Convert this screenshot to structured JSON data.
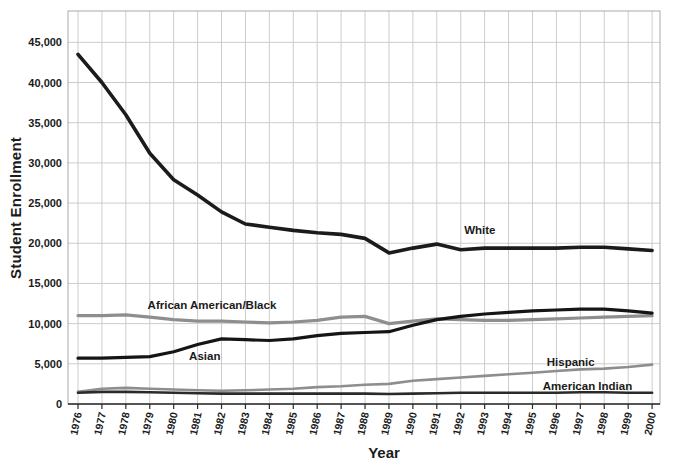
{
  "page": {
    "background": "#ffffff"
  },
  "chart_data": {
    "type": "line",
    "title": "",
    "xlabel": "Year",
    "ylabel": "Student Enrollment",
    "x": [
      1976,
      1977,
      1978,
      1979,
      1980,
      1981,
      1982,
      1983,
      1984,
      1985,
      1986,
      1987,
      1988,
      1989,
      1990,
      1991,
      1992,
      1993,
      1994,
      1995,
      1996,
      1997,
      1998,
      1999,
      2000
    ],
    "x_tick_labels": [
      "1976",
      "1977",
      "1978",
      "1979",
      "1980",
      "1981",
      "1982",
      "1983",
      "1984",
      "1985",
      "1986",
      "1987",
      "1988",
      "1989",
      "1990",
      "1991",
      "1992",
      "1993",
      "1994",
      "1995",
      "1996",
      "1997",
      "1998",
      "1999",
      "2000"
    ],
    "y_tick_values": [
      0,
      5000,
      10000,
      15000,
      20000,
      25000,
      30000,
      35000,
      40000,
      45000
    ],
    "y_tick_labels": [
      "0",
      "5,000",
      "10,000",
      "15,000",
      "20,000",
      "25,000",
      "30,000",
      "35,000",
      "40,000",
      "45,000"
    ],
    "ylim": [
      0,
      48900
    ],
    "grid": true,
    "legend_position": "inline-labels",
    "colors": {
      "gridline": "#cccccc",
      "plot_border": "#aaaaaa",
      "axis": "#2b2b2b",
      "text": "#1a1a1a"
    },
    "series": [
      {
        "name": "White",
        "color": "#1b1b1b",
        "width": 3.6,
        "label": {
          "text": "White",
          "year": 1992.8,
          "value": 21600
        },
        "values": [
          43500,
          40000,
          36000,
          31200,
          27900,
          26000,
          23900,
          22400,
          22000,
          21600,
          21300,
          21100,
          20600,
          18800,
          19400,
          19900,
          19200,
          19400,
          19400,
          19400,
          19400,
          19500,
          19500,
          19300,
          19100
        ]
      },
      {
        "name": "African American/Black",
        "color": "#8e8e8e",
        "width": 3.2,
        "label": {
          "text": "African American/Black",
          "year": 1981.6,
          "value": 12350
        },
        "values": [
          11000,
          11000,
          11100,
          10800,
          10500,
          10300,
          10300,
          10200,
          10100,
          10200,
          10400,
          10800,
          10900,
          10000,
          10300,
          10600,
          10500,
          10400,
          10400,
          10500,
          10600,
          10700,
          10800,
          10900,
          11000
        ]
      },
      {
        "name": "Asian",
        "color": "#151515",
        "width": 3.2,
        "label": {
          "text": "Asian",
          "year": 1981.3,
          "value": 5950
        },
        "values": [
          5700,
          5700,
          5800,
          5900,
          6500,
          7400,
          8100,
          8000,
          7900,
          8100,
          8500,
          8800,
          8900,
          9000,
          9800,
          10500,
          10900,
          11200,
          11400,
          11600,
          11700,
          11800,
          11800,
          11600,
          11300
        ]
      },
      {
        "name": "Hispanic",
        "color": "#8e8e8e",
        "width": 2.6,
        "label": {
          "text": "Hispanic",
          "year": 1996.6,
          "value": 5200
        },
        "values": [
          1500,
          1900,
          2000,
          1900,
          1800,
          1700,
          1650,
          1700,
          1800,
          1900,
          2100,
          2200,
          2400,
          2500,
          2900,
          3100,
          3300,
          3500,
          3700,
          3900,
          4100,
          4300,
          4400,
          4600,
          4900
        ]
      },
      {
        "name": "American Indian",
        "color": "#2a2a2a",
        "width": 2.6,
        "label": {
          "text": "American Indian",
          "year": 1997.3,
          "value": 2300
        },
        "values": [
          1400,
          1500,
          1500,
          1450,
          1400,
          1350,
          1300,
          1300,
          1300,
          1300,
          1300,
          1300,
          1300,
          1250,
          1300,
          1350,
          1400,
          1400,
          1400,
          1400,
          1400,
          1450,
          1450,
          1400,
          1400
        ]
      }
    ]
  }
}
